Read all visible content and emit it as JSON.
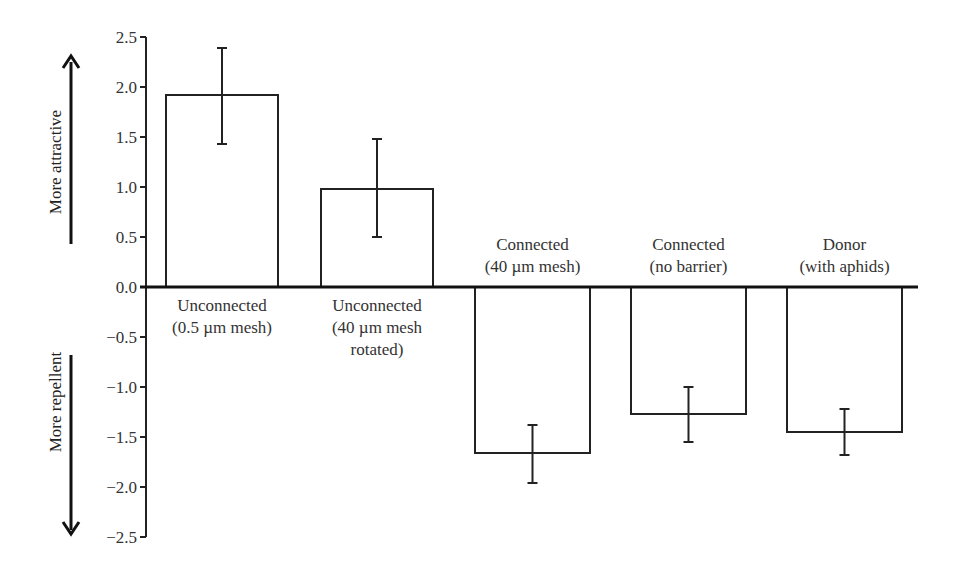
{
  "chart_data": {
    "type": "bar",
    "title": "",
    "xlabel": "",
    "ylabel": "",
    "ylim": [
      -2.5,
      2.5
    ],
    "yticks": [
      2.5,
      2.0,
      1.5,
      1.0,
      0.5,
      0.0,
      -0.5,
      -1.0,
      -1.5,
      -2.0,
      -2.5
    ],
    "ytick_labels": [
      "2.5",
      "2.0",
      "1.5",
      "1.0",
      "0.5",
      "0.0",
      "−0.5",
      "−1.0",
      "−1.5",
      "−2.0",
      "−2.5"
    ],
    "grid": false,
    "legend": null,
    "categories": [
      [
        "Unconnected",
        "(0.5 µm mesh)"
      ],
      [
        "Unconnected",
        "(40 µm mesh",
        "rotated)"
      ],
      [
        "Connected",
        "(40 µm mesh)"
      ],
      [
        "Connected",
        "(no barrier)"
      ],
      [
        "Donor",
        "(with aphids)"
      ]
    ],
    "values": [
      1.92,
      0.98,
      -1.66,
      -1.27,
      -1.45
    ],
    "error_bars": [
      {
        "upper": 2.39,
        "lower": 1.43
      },
      {
        "upper": 1.48,
        "lower": 0.5
      },
      {
        "upper": -1.38,
        "lower": -1.96
      },
      {
        "upper": -1.0,
        "lower": -1.55
      },
      {
        "upper": -1.22,
        "lower": -1.68
      }
    ],
    "annotations": {
      "positive_direction": "More attractive",
      "negative_direction": "More repellent"
    },
    "bar_fill": "#ffffff",
    "bar_stroke": "#222222"
  }
}
